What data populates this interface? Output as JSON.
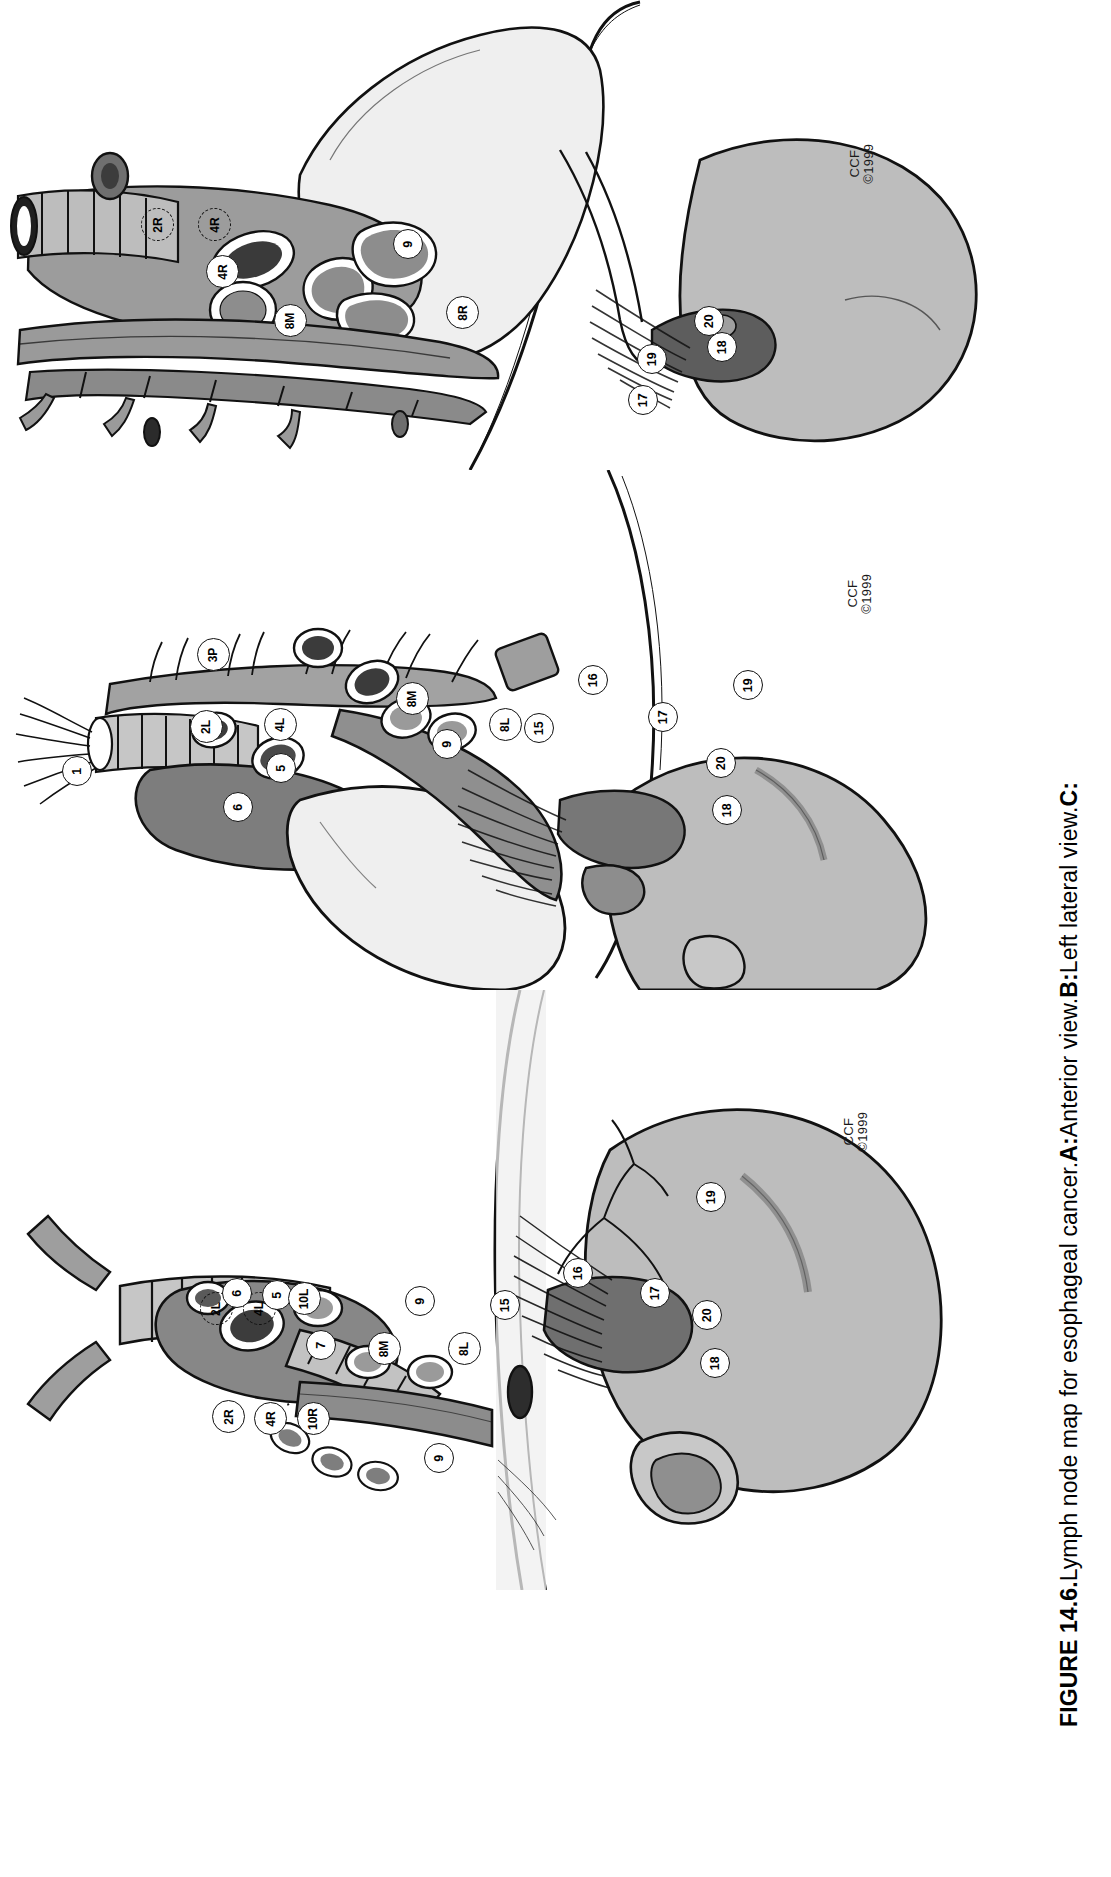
{
  "figure": {
    "number": "FIGURE 14.6.",
    "text_main": " Lymph node map for esophageal cancer. ",
    "label_a": "A:",
    "text_a": " Anterior view. ",
    "label_b": "B:",
    "text_b": " Left lateral view. ",
    "label_c": "C:"
  },
  "credit": {
    "line1": "CCF",
    "line2": "©1999"
  },
  "colors": {
    "ink": "#111111",
    "organ_light": "#e9e9e9",
    "organ_mid": "#b9b9b9",
    "organ_dark": "#8f8f8f",
    "vessel_dark": "#6f6f6f",
    "vessel_darkest": "#4a4a4a",
    "white": "#ffffff"
  },
  "panels": [
    {
      "id": "panel-c",
      "title": "C",
      "view": "Right lateral view",
      "nodes": [
        {
          "label": "2R",
          "style": "dashed"
        },
        {
          "label": "4R",
          "style": "dashed"
        },
        {
          "label": "4R",
          "style": "solid"
        },
        {
          "label": "9",
          "style": "solid"
        },
        {
          "label": "8M",
          "style": "solid"
        },
        {
          "label": "8R",
          "style": "solid"
        },
        {
          "label": "17",
          "style": "solid"
        },
        {
          "label": "18",
          "style": "solid"
        },
        {
          "label": "19",
          "style": "solid"
        },
        {
          "label": "20",
          "style": "solid"
        }
      ]
    },
    {
      "id": "panel-b",
      "title": "B",
      "view": "Left lateral view",
      "nodes": [
        {
          "label": "1",
          "style": "solid"
        },
        {
          "label": "2L",
          "style": "solid"
        },
        {
          "label": "3P",
          "style": "solid"
        },
        {
          "label": "4L",
          "style": "solid"
        },
        {
          "label": "5",
          "style": "solid"
        },
        {
          "label": "6",
          "style": "solid"
        },
        {
          "label": "8M",
          "style": "solid"
        },
        {
          "label": "8L",
          "style": "solid"
        },
        {
          "label": "9",
          "style": "solid"
        },
        {
          "label": "15",
          "style": "solid"
        },
        {
          "label": "16",
          "style": "solid"
        },
        {
          "label": "17",
          "style": "solid"
        },
        {
          "label": "18",
          "style": "solid"
        },
        {
          "label": "19",
          "style": "solid"
        },
        {
          "label": "20",
          "style": "solid"
        }
      ]
    },
    {
      "id": "panel-a",
      "title": "A",
      "view": "Anterior view",
      "nodes": [
        {
          "label": "2R",
          "style": "solid"
        },
        {
          "label": "2L",
          "style": "dashed"
        },
        {
          "label": "4R",
          "style": "solid"
        },
        {
          "label": "4L",
          "style": "dashed"
        },
        {
          "label": "5",
          "style": "solid"
        },
        {
          "label": "6",
          "style": "solid"
        },
        {
          "label": "7",
          "style": "solid"
        },
        {
          "label": "9",
          "style": "solid"
        },
        {
          "label": "9",
          "style": "solid"
        },
        {
          "label": "10R",
          "style": "solid"
        },
        {
          "label": "10L",
          "style": "solid"
        },
        {
          "label": "8M",
          "style": "solid"
        },
        {
          "label": "8L",
          "style": "solid"
        },
        {
          "label": "15",
          "style": "solid"
        },
        {
          "label": "16",
          "style": "solid"
        },
        {
          "label": "17",
          "style": "solid"
        },
        {
          "label": "18",
          "style": "solid"
        },
        {
          "label": "19",
          "style": "solid"
        },
        {
          "label": "20",
          "style": "solid"
        }
      ]
    }
  ]
}
